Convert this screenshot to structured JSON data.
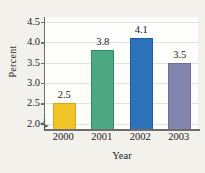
{
  "chart_data": {
    "type": "bar",
    "title": "",
    "categories": [
      "2000",
      "2001",
      "2002",
      "2003"
    ],
    "values": [
      2.5,
      3.8,
      4.1,
      3.5
    ],
    "value_labels": [
      "2.5",
      "3.8",
      "4.1",
      "3.5"
    ],
    "xlabel": "Year",
    "ylabel": "Percent",
    "ylim": [
      1.85,
      4.62
    ],
    "yticks": [
      2.0,
      2.5,
      3.0,
      3.5,
      4.0,
      4.5
    ],
    "ytick_labels": [
      "2.0",
      "2.5",
      "3.0",
      "3.5",
      "4.0",
      "4.5"
    ],
    "grid": true,
    "legend": null,
    "axis_break": true,
    "bar_colors": [
      "#f0c426",
      "#4ba882",
      "#2d72b8",
      "#8285ad"
    ],
    "bar_edge_colors": [
      "#d6a714",
      "#2f8c68",
      "#1c5c9e",
      "#6e7196"
    ]
  },
  "figure": {
    "background": "#f2f1ec",
    "plot_background": "#fdfdfb",
    "axis_color": "#6d6d6d",
    "gridline_color": "#e2e2dc",
    "title_clipped": ""
  }
}
